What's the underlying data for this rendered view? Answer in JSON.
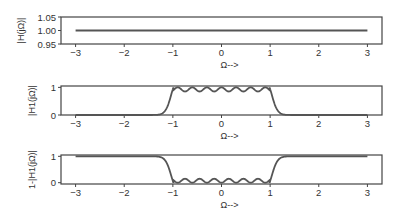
{
  "chart_data": [
    {
      "type": "line",
      "title": "",
      "ylabel": "|H(jΩ)|",
      "xlabel": "Ω-->",
      "xlim": [
        -3.3,
        3.3
      ],
      "ylim": [
        0.95,
        1.05
      ],
      "xticks": [
        "-3",
        "-2",
        "-1",
        "0",
        "1",
        "2",
        "3"
      ],
      "yticks": [
        "0.95",
        "1.00",
        "1.05"
      ],
      "grid": false,
      "series": [
        {
          "name": "|H(jΩ)|",
          "x": [
            -3,
            3
          ],
          "values": [
            1.0,
            1.0
          ]
        }
      ]
    },
    {
      "type": "line",
      "title": "",
      "ylabel": "|H1(jΩ)|",
      "xlabel": "Ω-->",
      "xlim": [
        -3.3,
        3.3
      ],
      "ylim": [
        0,
        1.05
      ],
      "xticks": [
        "-3",
        "-2",
        "-1",
        "0",
        "1",
        "2",
        "3"
      ],
      "yticks": [
        "0",
        "1"
      ],
      "grid": false,
      "series": [
        {
          "name": "|H1(jΩ)|",
          "description": "Equiripple low-pass magnitude, passband |Ω|<1 with ripple ~0.85–1.0, stopband ~0",
          "x": [
            -3,
            -1.5,
            -1.2,
            -1.1,
            -1.0,
            -0.9,
            -0.75,
            -0.6,
            -0.45,
            -0.3,
            -0.15,
            0,
            0.15,
            0.3,
            0.45,
            0.6,
            0.75,
            0.9,
            1.0,
            1.1,
            1.2,
            1.5,
            3
          ],
          "values": [
            0,
            0.01,
            0.08,
            0.3,
            0.85,
            1.0,
            0.86,
            1.0,
            0.86,
            1.0,
            0.86,
            1.0,
            0.86,
            1.0,
            0.86,
            1.0,
            0.86,
            1.0,
            0.85,
            0.3,
            0.08,
            0.01,
            0
          ]
        }
      ]
    },
    {
      "type": "line",
      "title": "",
      "ylabel": "1-|H1(jΩ)|",
      "xlabel": "Ω-->",
      "xlim": [
        -3.3,
        3.3
      ],
      "ylim": [
        -0.05,
        1.05
      ],
      "xticks": [
        "-3",
        "-2",
        "-1",
        "0",
        "1",
        "2",
        "3"
      ],
      "yticks": [
        "0",
        "1"
      ],
      "grid": false,
      "series": [
        {
          "name": "1-|H1(jΩ)|",
          "description": "Complement of low-pass: high-pass shape, ~1 outside |Ω|>1, ripple ~0–0.15 inside",
          "x": [
            -3,
            -1.5,
            -1.2,
            -1.1,
            -1.0,
            -0.9,
            -0.75,
            -0.6,
            -0.45,
            -0.3,
            -0.15,
            0,
            0.15,
            0.3,
            0.45,
            0.6,
            0.75,
            0.9,
            1.0,
            1.1,
            1.2,
            1.5,
            3
          ],
          "values": [
            1,
            0.99,
            0.92,
            0.7,
            0.15,
            0.0,
            0.14,
            0.0,
            0.14,
            0.0,
            0.14,
            0.0,
            0.14,
            0.0,
            0.14,
            0.0,
            0.14,
            0.0,
            0.15,
            0.7,
            0.92,
            0.99,
            1
          ]
        }
      ]
    }
  ],
  "style": {
    "line_color": "#555555",
    "axis_color": "#444444"
  }
}
